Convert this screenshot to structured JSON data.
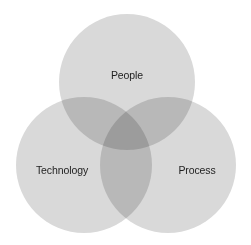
{
  "diagram": {
    "type": "venn",
    "sets": [
      {
        "id": "people",
        "label": "People",
        "cx": 127,
        "cy": 82,
        "r": 68,
        "label_x": 127,
        "label_y": 75
      },
      {
        "id": "technology",
        "label": "Technology",
        "cx": 84,
        "cy": 165,
        "r": 68,
        "label_x": 62,
        "label_y": 170
      },
      {
        "id": "process",
        "label": "Process",
        "cx": 168,
        "cy": 165,
        "r": 68,
        "label_x": 197,
        "label_y": 170
      }
    ],
    "colors": {
      "circle_fill": "#d9d9d9",
      "background": "#ffffff",
      "text": "#1e1e1e"
    }
  }
}
